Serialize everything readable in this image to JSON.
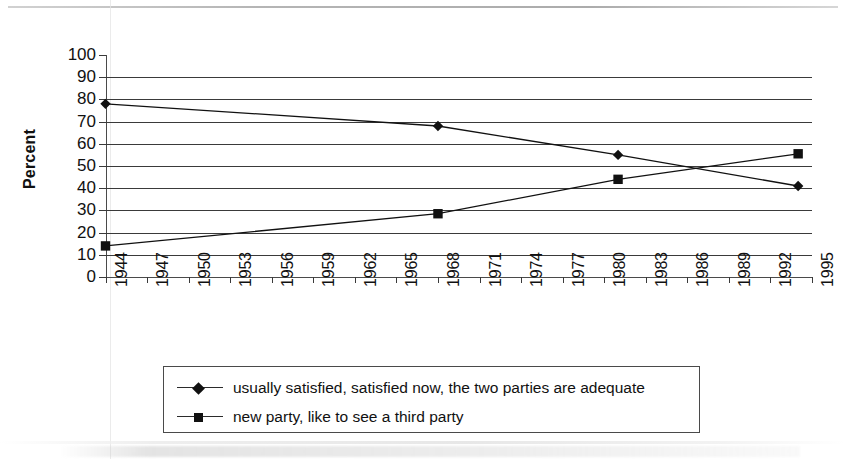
{
  "chart_data": {
    "type": "line",
    "title": "",
    "xlabel": "",
    "ylabel": "Percent",
    "ylim": [
      0,
      100
    ],
    "ytick_labels": [
      "100",
      "90",
      "80",
      "70",
      "60",
      "50",
      "40",
      "30",
      "20",
      "10",
      "0"
    ],
    "ytick_values": [
      100,
      90,
      80,
      70,
      60,
      50,
      40,
      30,
      20,
      10,
      0
    ],
    "ytick_step": 10,
    "grid": "horizontal",
    "xlim": [
      1944,
      1995
    ],
    "x_tick_labels": [
      "1944",
      "1947",
      "1950",
      "1953",
      "1956",
      "1959",
      "1962",
      "1965",
      "1968",
      "1971",
      "1974",
      "1977",
      "1980",
      "1983",
      "1986",
      "1989",
      "1992",
      "1995"
    ],
    "x_tick_values": [
      1944,
      1947,
      1950,
      1953,
      1956,
      1959,
      1962,
      1965,
      1968,
      1971,
      1974,
      1977,
      1980,
      1983,
      1986,
      1989,
      1992,
      1995
    ],
    "x_tick_rotation": -90,
    "legend_position": "bottom",
    "series": [
      {
        "name": "usually satisfied, satisfied now, the two parties are adequate",
        "marker": "diamond",
        "color": "#111111",
        "linestyle": "solid",
        "x": [
          1944,
          1968,
          1981,
          1994
        ],
        "values": [
          78,
          68,
          55,
          41
        ]
      },
      {
        "name": "new party, like to see a third party",
        "marker": "square",
        "color": "#111111",
        "linestyle": "solid",
        "x": [
          1944,
          1968,
          1981,
          1994
        ],
        "values": [
          14,
          28.5,
          44,
          55.5
        ]
      }
    ]
  },
  "legend": {
    "entries": [
      {
        "label": "usually satisfied, satisfied now, the two parties are adequate",
        "marker": "diamond"
      },
      {
        "label": "new party, like to see a third party",
        "marker": "square"
      }
    ]
  },
  "axis": {
    "y_title": "Percent"
  },
  "colors": {
    "ink": "#111111",
    "gridline": "#3a3a3a",
    "axis": "#4a4a4a",
    "background": "#ffffff"
  }
}
